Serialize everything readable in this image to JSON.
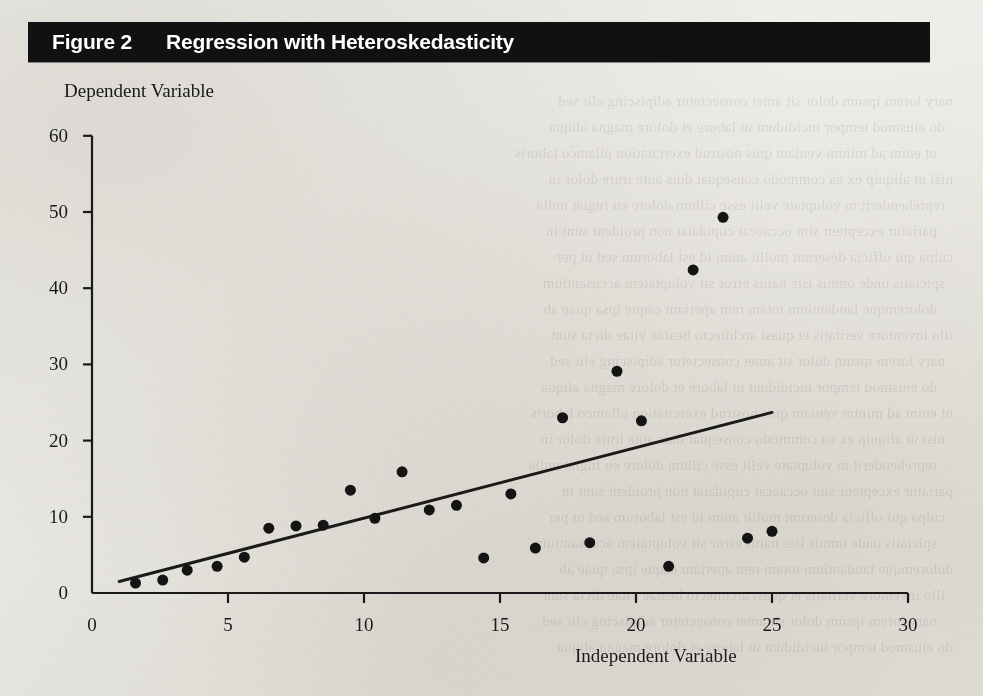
{
  "figure": {
    "number_label": "Figure 2",
    "title": "Regression with Heteroskedasticity",
    "bar_color": "#111013",
    "bar_text_color": "#ffffff",
    "page_background": "#efeeea"
  },
  "chart_data": {
    "type": "scatter",
    "title": "Regression with Heteroskedasticity",
    "xlabel": "Independent Variable",
    "ylabel": "Dependent Variable",
    "xlim": [
      0,
      30
    ],
    "ylim": [
      0,
      60
    ],
    "xticks": [
      0,
      5,
      10,
      15,
      20,
      25,
      30
    ],
    "yticks": [
      0,
      10,
      20,
      30,
      40,
      50,
      60
    ],
    "xtick_labels": [
      "0",
      "5",
      "10",
      "15",
      "20",
      "25",
      "30"
    ],
    "ytick_labels": [
      "0",
      "10",
      "20",
      "30",
      "40",
      "50",
      "60"
    ],
    "grid": false,
    "legend": false,
    "marker_color": "#141414",
    "marker_size": 11,
    "line_color": "#1a1a1a",
    "line_width": 3,
    "points": [
      {
        "x": 1.6,
        "y": 1.3
      },
      {
        "x": 2.6,
        "y": 1.7
      },
      {
        "x": 3.5,
        "y": 3.0
      },
      {
        "x": 4.6,
        "y": 3.5
      },
      {
        "x": 5.6,
        "y": 4.7
      },
      {
        "x": 6.5,
        "y": 8.5
      },
      {
        "x": 7.5,
        "y": 8.8
      },
      {
        "x": 8.5,
        "y": 8.9
      },
      {
        "x": 9.5,
        "y": 13.5
      },
      {
        "x": 10.4,
        "y": 9.8
      },
      {
        "x": 11.4,
        "y": 15.9
      },
      {
        "x": 12.4,
        "y": 10.9
      },
      {
        "x": 13.4,
        "y": 11.5
      },
      {
        "x": 14.4,
        "y": 4.6
      },
      {
        "x": 15.4,
        "y": 13.0
      },
      {
        "x": 16.3,
        "y": 5.9
      },
      {
        "x": 17.3,
        "y": 23.0
      },
      {
        "x": 18.3,
        "y": 6.6
      },
      {
        "x": 19.3,
        "y": 29.1
      },
      {
        "x": 20.2,
        "y": 22.6
      },
      {
        "x": 21.2,
        "y": 3.5
      },
      {
        "x": 22.1,
        "y": 42.4
      },
      {
        "x": 23.2,
        "y": 49.3
      },
      {
        "x": 24.1,
        "y": 7.2
      },
      {
        "x": 25.0,
        "y": 8.1
      }
    ],
    "regression_line": {
      "x0": 1.0,
      "y0": 1.5,
      "x1": 25.0,
      "y1": 23.7
    }
  },
  "bleed_text": [
    "nary lorem ipsum dolor sit amet consectetur adipiscing elit sed",
    "do eiusmod tempor incididunt ut labore et dolore magna aliqua",
    "ut enim ad minim veniam quis nostrud exercitation ullamco laboris",
    "nisi ut aliquip ex ea commodo consequat duis aute irure dolor in",
    "reprehenderit in voluptate velit esse cillum dolore eu fugiat nulla",
    "pariatur excepteur sint occaecat cupidatat non proident sunt in",
    "culpa qui officia deserunt mollit anim id est laborum sed ut per",
    "spiciatis unde omnis iste natus error sit voluptatem accusantium",
    "doloremque laudantium totam rem aperiam eaque ipsa quae ab",
    "illo inventore veritatis et quasi architecto beatae vitae dicta sunt"
  ]
}
